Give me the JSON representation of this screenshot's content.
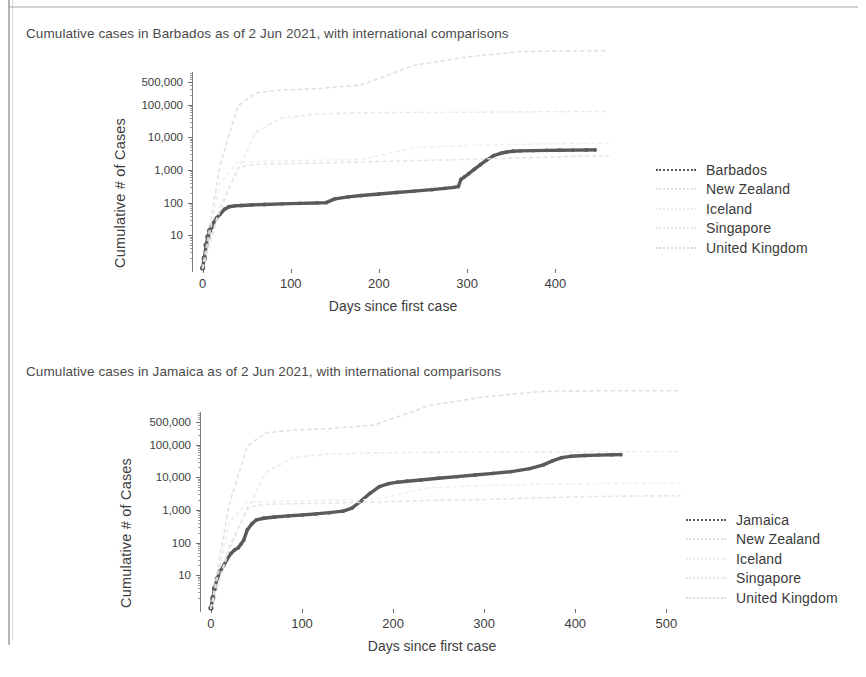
{
  "document": {
    "kind": "scanned-report-page",
    "ink_color": "#555555",
    "highlight_color": "#4a4a4a"
  },
  "figures": [
    {
      "id": "barbados",
      "title": "Cumulative cases in Barbados as of  2 Jun 2021, with international comparisons",
      "legend": [
        {
          "label": "Barbados",
          "color": "#5a5a5a",
          "emphasis": true
        },
        {
          "label": "New Zealand",
          "color": "#e2e2e2",
          "emphasis": false
        },
        {
          "label": "Iceland",
          "color": "#ededed",
          "emphasis": false
        },
        {
          "label": "Singapore",
          "color": "#e7e7e7",
          "emphasis": false
        },
        {
          "label": "United Kingdom",
          "color": "#dcdcdc",
          "emphasis": false
        }
      ],
      "chart_data": {
        "type": "line",
        "title": "Cumulative cases in Barbados as of  2 Jun 2021, with international comparisons",
        "xlabel": "Days since first case",
        "ylabel": "Cumulative # of Cases",
        "yscale": "log",
        "ylim": [
          1,
          1000000
        ],
        "xlim": [
          -12,
          462
        ],
        "xticks": [
          0,
          100,
          200,
          300,
          400
        ],
        "yticks": [
          10,
          100,
          1000,
          10000,
          100000,
          500000
        ],
        "ytick_labels": [
          "10",
          "100",
          "1,000",
          "10,000",
          "100,000",
          "500,000"
        ],
        "grid": false,
        "legend_position": "right",
        "series": [
          {
            "name": "Barbados",
            "emphasis": true,
            "x": [
              0,
              2,
              4,
              6,
              8,
              10,
              13,
              16,
              20,
              25,
              30,
              36,
              44,
              55,
              70,
              90,
              110,
              130,
              140,
              150,
              165,
              180,
              200,
              220,
              240,
              260,
              275,
              285,
              290,
              293,
              297,
              302,
              308,
              315,
              322,
              330,
              338,
              345,
              352,
              360,
              375,
              390,
              405,
              420,
              435,
              445
            ],
            "y": [
              1,
              2,
              5,
              9,
              14,
              18,
              26,
              34,
              45,
              63,
              75,
              80,
              82,
              85,
              88,
              92,
              95,
              98,
              100,
              130,
              150,
              165,
              185,
              205,
              225,
              250,
              275,
              295,
              310,
              520,
              620,
              780,
              1050,
              1450,
              2000,
              2750,
              3250,
              3550,
              3750,
              3850,
              3920,
              3980,
              4020,
              4060,
              4090,
              4120
            ]
          },
          {
            "name": "New Zealand",
            "emphasis": false,
            "x": [
              0,
              20,
              40,
              60,
              90,
              130,
              180,
              240,
              300,
              360,
              420,
              460
            ],
            "y": [
              1,
              60,
              1200,
              1500,
              1560,
              1620,
              1750,
              1950,
              2100,
              2350,
              2600,
              2700
            ]
          },
          {
            "name": "Iceland",
            "emphasis": false,
            "x": [
              0,
              20,
              40,
              60,
              90,
              130,
              180,
              240,
              300,
              360,
              420,
              460
            ],
            "y": [
              1,
              400,
              1750,
              1810,
              1870,
              1980,
              2100,
              4800,
              5600,
              6100,
              6500,
              6600
            ]
          },
          {
            "name": "Singapore",
            "emphasis": false,
            "x": [
              0,
              20,
              40,
              60,
              90,
              130,
              180,
              240,
              300,
              360,
              420,
              460
            ],
            "y": [
              1,
              80,
              1000,
              14000,
              40000,
              52000,
              56000,
              58000,
              58500,
              60000,
              61500,
              62000
            ]
          },
          {
            "name": "United Kingdom",
            "emphasis": false,
            "x": [
              0,
              20,
              40,
              60,
              90,
              130,
              180,
              240,
              300,
              360,
              420,
              460
            ],
            "y": [
              1,
              1500,
              90000,
              230000,
              280000,
              310000,
              400000,
              1600000,
              2900000,
              4200000,
              4450000,
              4490000
            ]
          }
        ]
      }
    },
    {
      "id": "jamaica",
      "title": "Cumulative cases in Jamaica as of  2 Jun 2021, with international comparisons",
      "legend": [
        {
          "label": "Jamaica",
          "color": "#5a5a5a",
          "emphasis": true
        },
        {
          "label": "New Zealand",
          "color": "#e2e2e2",
          "emphasis": false
        },
        {
          "label": "Iceland",
          "color": "#ededed",
          "emphasis": false
        },
        {
          "label": "Singapore",
          "color": "#e7e7e7",
          "emphasis": false
        },
        {
          "label": "United Kingdom",
          "color": "#dcdcdc",
          "emphasis": false
        }
      ],
      "chart_data": {
        "type": "line",
        "title": "Cumulative cases in Jamaica as of  2 Jun 2021, with international comparisons",
        "xlabel": "Days since first case",
        "ylabel": "Cumulative # of Cases",
        "yscale": "log",
        "ylim": [
          1,
          1000000
        ],
        "xlim": [
          -12,
          515
        ],
        "xticks": [
          0,
          100,
          200,
          300,
          400,
          500
        ],
        "yticks": [
          10,
          100,
          1000,
          10000,
          100000,
          500000
        ],
        "ytick_labels": [
          "10",
          "100",
          "1,000",
          "10,000",
          "100,000",
          "500,000"
        ],
        "grid": false,
        "legend_position": "right",
        "series": [
          {
            "name": "Jamaica",
            "emphasis": true,
            "x": [
              0,
              2,
              4,
              7,
              10,
              14,
              18,
              22,
              26,
              30,
              33,
              36,
              40,
              45,
              50,
              58,
              70,
              85,
              100,
              115,
              130,
              145,
              155,
              165,
              175,
              185,
              195,
              205,
              215,
              230,
              250,
              270,
              290,
              310,
              330,
              350,
              365,
              375,
              385,
              395,
              410,
              425,
              440,
              450
            ],
            "y": [
              1,
              2,
              4,
              8,
              13,
              20,
              32,
              47,
              60,
              70,
              90,
              120,
              250,
              380,
              500,
              560,
              610,
              660,
              700,
              760,
              830,
              920,
              1150,
              1900,
              3300,
              5200,
              6400,
              7100,
              7600,
              8300,
              9400,
              10500,
              11800,
              13200,
              15000,
              18500,
              24000,
              32000,
              40000,
              44000,
              46500,
              48000,
              49000,
              49500
            ]
          },
          {
            "name": "New Zealand",
            "emphasis": false,
            "x": [
              0,
              20,
              40,
              60,
              90,
              130,
              180,
              240,
              300,
              360,
              420,
              480,
              515
            ],
            "y": [
              1,
              60,
              1200,
              1500,
              1560,
              1620,
              1750,
              1950,
              2100,
              2350,
              2600,
              2700,
              2720
            ]
          },
          {
            "name": "Iceland",
            "emphasis": false,
            "x": [
              0,
              20,
              40,
              60,
              90,
              130,
              180,
              240,
              300,
              360,
              420,
              480,
              515
            ],
            "y": [
              1,
              400,
              1750,
              1810,
              1870,
              1980,
              2100,
              4800,
              5600,
              6100,
              6500,
              6600,
              6620
            ]
          },
          {
            "name": "Singapore",
            "emphasis": false,
            "x": [
              0,
              20,
              40,
              60,
              90,
              130,
              180,
              240,
              300,
              360,
              420,
              480,
              515
            ],
            "y": [
              1,
              80,
              1000,
              14000,
              40000,
              52000,
              56000,
              58000,
              58500,
              60000,
              61500,
              62000,
              62100
            ]
          },
          {
            "name": "United Kingdom",
            "emphasis": false,
            "x": [
              0,
              20,
              40,
              60,
              90,
              130,
              180,
              240,
              300,
              360,
              420,
              480,
              515
            ],
            "y": [
              1,
              1500,
              90000,
              230000,
              280000,
              310000,
              400000,
              1600000,
              2900000,
              4200000,
              4450000,
              4490000,
              4495000
            ]
          }
        ]
      }
    }
  ]
}
